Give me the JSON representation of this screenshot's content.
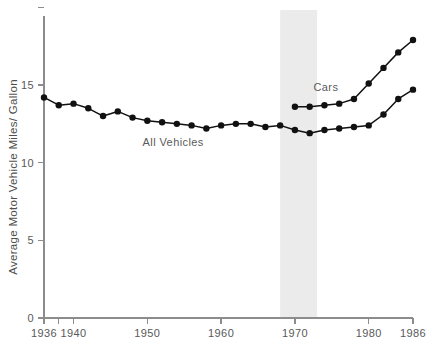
{
  "chart_data": {
    "type": "line",
    "title": "",
    "xlabel": "",
    "ylabel": "Average Motor Vehicle Miles/ Gallon",
    "xlim": [
      1936,
      1986
    ],
    "ylim": [
      0,
      20
    ],
    "grid": false,
    "legend": "inline-annotations",
    "y_ticks": [
      0,
      5,
      10,
      15,
      20
    ],
    "y_tick_labels": [
      "0",
      "5",
      "10",
      "15",
      ""
    ],
    "x_ticks": [
      1936,
      1938,
      1940,
      1950,
      1960,
      1970,
      1980,
      1986
    ],
    "x_tick_labels": [
      "1936",
      "",
      "1940",
      "1950",
      "1960",
      "1970",
      "1980",
      "1986"
    ],
    "shaded_band": {
      "label": "",
      "x_start": 1968,
      "x_end": 1973,
      "color": "#ebebeb"
    },
    "series": [
      {
        "name": "All Vehicles",
        "label_x": 1953.5,
        "label_y": 11.1,
        "color": "#111111",
        "x": [
          1936,
          1938,
          1940,
          1942,
          1944,
          1946,
          1948,
          1950,
          1952,
          1954,
          1956,
          1958,
          1960,
          1962,
          1964,
          1966,
          1968,
          1970,
          1972,
          1974,
          1976,
          1978,
          1980,
          1982,
          1984,
          1986
        ],
        "values": [
          14.2,
          13.7,
          13.8,
          13.5,
          13.0,
          13.3,
          12.9,
          12.7,
          12.6,
          12.5,
          12.4,
          12.2,
          12.4,
          12.5,
          12.5,
          12.3,
          12.4,
          12.1,
          11.9,
          12.1,
          12.2,
          12.3,
          12.4,
          13.1,
          14.1,
          14.7
        ],
        "label": "All Vehicles"
      },
      {
        "name": "Cars",
        "label_x": 1974.2,
        "label_y": 14.6,
        "color": "#111111",
        "x": [
          1970,
          1972,
          1974,
          1976,
          1978,
          1980,
          1982,
          1984,
          1986
        ],
        "values": [
          13.6,
          13.6,
          13.7,
          13.8,
          14.1,
          15.1,
          16.1,
          17.1,
          17.9
        ],
        "label": "Cars"
      }
    ]
  },
  "labels": {
    "y_axis_title": "Average Motor Vehicle Miles/ Gallon",
    "series_all_vehicles": "All Vehicles",
    "series_cars": "Cars",
    "ytick_0": "0",
    "ytick_5": "5",
    "ytick_10": "10",
    "ytick_15": "15",
    "xtick_1936": "1936",
    "xtick_1940": "1940",
    "xtick_1950": "1950",
    "xtick_1960": "1960",
    "xtick_1970": "1970",
    "xtick_1980": "1980",
    "xtick_1986": "1986"
  }
}
